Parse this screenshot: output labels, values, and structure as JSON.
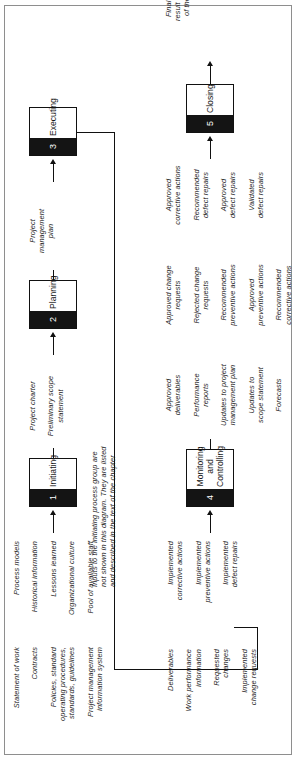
{
  "diagram": {
    "orientation": "rotated-90-ccw",
    "note": "Inputs to the initiating process group are\nnot shown in this diagram. They are listed\nand described in the text of the chapter"
  },
  "process_groups": [
    {
      "number": "1",
      "name": "Initiating"
    },
    {
      "number": "2",
      "name": "Planning"
    },
    {
      "number": "3",
      "name": "Executing"
    },
    {
      "number": "4",
      "name": "Monitoring\nand\nControlling"
    },
    {
      "number": "5",
      "name": "Closing"
    }
  ],
  "inputs": {
    "column_a": "Statement of work\n\nContracts\n\nPolicies, standard\noperating procedures,\nstandards, guidelines\n\nProject management\ninformation system",
    "column_b": "Process models\n\nHistorical information\n\nLessons learned\n\nOrganizational culture\n\nPool of available staff"
  },
  "flows": {
    "initiating_to_planning": "Project charter\n\nPreliminary scope\nstatement",
    "planning_to_executing": "Project\nmanagement\nplan",
    "closing_output": "Final product,\nresult or service\nof the project"
  },
  "executing_outputs": {
    "column_a": "Deliverables\n\nWork performance\ninformation\n\nRequested\nchanges\n\nImplemented\nchange requests",
    "column_b": "Implemented\ncorrective actions\n\nImplemented\npreventive actions\n\nImplemented\ndefect repairs"
  },
  "monitoring_outputs": {
    "column_a": "Approved\ndeliverables\n\nPerformance\nreports\n\nUpdates to project\nmanagement plan\n\nUpdates to\nscope statement\n\nForecasts",
    "column_b": "Approved change\nrequests\n\nRejected change\nrequests\n\nRecommended\npreventive actions\n\nApproved\npreventive actions\n\nRecommended\ncorrective actions",
    "column_c": "Approved\ncorrective actions\n\nRecommended\ndefect repairs\n\nApproved\ndefect repairs\n\nValidated\ndefect repairs"
  },
  "colors": {
    "line": "#111111",
    "number_block": "#141414",
    "frame": "#8e8e8e",
    "page": "#ffffff"
  }
}
